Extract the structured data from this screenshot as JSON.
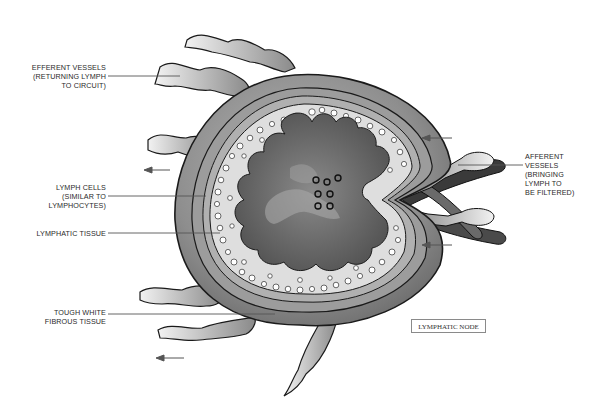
{
  "diagram": {
    "title": "LYMPHATIC NODE",
    "labels": {
      "efferent": [
        "EFFERENT VESSELS",
        "(RETURNING LYMPH",
        "TO CIRCUIT)"
      ],
      "lymph_cells": [
        "LYMPH CELLS",
        "(SIMILAR TO",
        "LYMPHOCYTES)"
      ],
      "lymphatic_tissue": [
        "LYMPHATIC TISSUE"
      ],
      "fibrous_tissue": [
        "TOUGH WHITE",
        "FIBROUS TISSUE"
      ],
      "afferent": [
        "AFFERENT",
        "VESSELS",
        "(BRINGING",
        "LYMPH TO",
        "BE FILTERED)"
      ]
    },
    "arrows": [
      {
        "direction": "left",
        "x": 150,
        "y": 170,
        "meaning": "efferent flow out"
      },
      {
        "direction": "left",
        "x": 155,
        "y": 357,
        "meaning": "efferent flow out"
      },
      {
        "direction": "left",
        "x": 428,
        "y": 138,
        "meaning": "afferent flow in"
      },
      {
        "direction": "left",
        "x": 428,
        "y": 245,
        "meaning": "afferent flow in"
      }
    ],
    "colors": {
      "capsule_outer": "#8c8c8c",
      "capsule_inner": "#a8a8a8",
      "tissue_fill": "#dcdcdc",
      "core_dark": "#5e5e5e",
      "outline": "#1a1a1a",
      "background": "#ffffff"
    }
  }
}
